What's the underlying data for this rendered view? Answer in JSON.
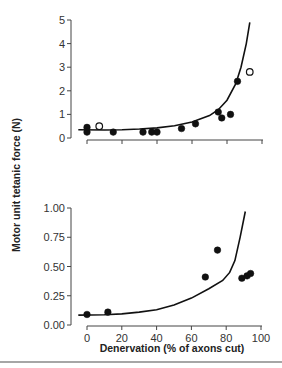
{
  "chart_data": [
    {
      "type": "scatter",
      "panel": "top",
      "title": "",
      "xlabel": "",
      "ylabel": "Motor unit tetanic force (N)",
      "xlim": [
        0,
        100
      ],
      "ylim": [
        0,
        5
      ],
      "xticks": [
        0,
        20,
        40,
        60,
        80,
        100
      ],
      "xtick_labels_visible": false,
      "yticks": [
        0,
        1,
        2,
        3,
        4,
        5
      ],
      "ytick_labels": [
        "0",
        "1",
        "2",
        "3",
        "4",
        "5"
      ],
      "grid": false,
      "series": [
        {
          "name": "filled",
          "marker": "filled-circle",
          "points": [
            [
              0,
              0.45
            ],
            [
              0,
              0.25
            ],
            [
              15,
              0.25
            ],
            [
              32,
              0.25
            ],
            [
              37,
              0.25
            ],
            [
              40,
              0.25
            ],
            [
              54,
              0.4
            ],
            [
              62,
              0.6
            ],
            [
              75,
              1.1
            ],
            [
              77,
              0.85
            ],
            [
              82,
              1.0
            ],
            [
              86,
              2.4
            ]
          ]
        },
        {
          "name": "open",
          "marker": "open-circle",
          "points": [
            [
              7,
              0.5
            ],
            [
              93,
              2.8
            ]
          ]
        },
        {
          "name": "fit",
          "marker": "line",
          "points": [
            [
              -5,
              0.35
            ],
            [
              10,
              0.34
            ],
            [
              20,
              0.35
            ],
            [
              30,
              0.38
            ],
            [
              40,
              0.43
            ],
            [
              50,
              0.52
            ],
            [
              60,
              0.68
            ],
            [
              70,
              0.95
            ],
            [
              75,
              1.2
            ],
            [
              80,
              1.6
            ],
            [
              85,
              2.3
            ],
            [
              88,
              3.0
            ],
            [
              91,
              4.0
            ],
            [
              93,
              4.9
            ]
          ]
        }
      ]
    },
    {
      "type": "scatter",
      "panel": "bottom",
      "title": "",
      "xlabel": "Denervation (% of axons cut)",
      "ylabel": "Motor unit tetanic force (N)",
      "xlim": [
        0,
        100
      ],
      "ylim": [
        0,
        1.0
      ],
      "xticks": [
        0,
        20,
        40,
        60,
        80,
        100
      ],
      "xtick_labels": [
        "0",
        "20",
        "40",
        "60",
        "80",
        "100"
      ],
      "yticks": [
        0,
        0.25,
        0.5,
        0.75,
        1.0
      ],
      "ytick_labels": [
        "0.00",
        "0.25",
        "0.50",
        "0.75",
        "1.00"
      ],
      "grid": false,
      "series": [
        {
          "name": "filled",
          "marker": "filled-circle",
          "points": [
            [
              0,
              0.09
            ],
            [
              12,
              0.11
            ],
            [
              68,
              0.41
            ],
            [
              75,
              0.64
            ],
            [
              89,
              0.4
            ],
            [
              92,
              0.42
            ],
            [
              94,
              0.44
            ]
          ]
        },
        {
          "name": "fit",
          "marker": "line",
          "points": [
            [
              -5,
              0.085
            ],
            [
              10,
              0.088
            ],
            [
              20,
              0.095
            ],
            [
              30,
              0.11
            ],
            [
              40,
              0.13
            ],
            [
              50,
              0.17
            ],
            [
              60,
              0.23
            ],
            [
              70,
              0.31
            ],
            [
              78,
              0.38
            ],
            [
              82,
              0.45
            ],
            [
              85,
              0.55
            ],
            [
              88,
              0.75
            ],
            [
              91,
              0.97
            ]
          ]
        }
      ]
    }
  ],
  "labels": {
    "ylabel": "Motor unit tetanic force (N)",
    "xlabel": "Denervation (% of axons cut)",
    "top_yticks": [
      "0",
      "1",
      "2",
      "3",
      "4",
      "5"
    ],
    "bottom_yticks": [
      "0.00",
      "0.25",
      "0.50",
      "0.75",
      "1.00"
    ],
    "bottom_xticks": [
      "0",
      "20",
      "40",
      "60",
      "80",
      "100"
    ]
  }
}
